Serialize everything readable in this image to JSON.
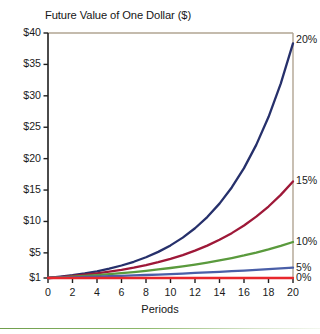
{
  "chart_data": {
    "type": "line",
    "title": "Future Value of One Dollar ($)",
    "xlabel": "Periods",
    "ylabel": "",
    "xlim": [
      0,
      20
    ],
    "ylim": [
      1,
      40
    ],
    "grid": false,
    "legend_position": "right-of-line-ends",
    "x": [
      0,
      1,
      2,
      3,
      4,
      5,
      6,
      7,
      8,
      9,
      10,
      11,
      12,
      13,
      14,
      15,
      16,
      17,
      18,
      19,
      20
    ],
    "xticks": [
      "0",
      "2",
      "4",
      "6",
      "8",
      "10",
      "12",
      "14",
      "16",
      "18",
      "20"
    ],
    "xtick_values": [
      0,
      2,
      4,
      6,
      8,
      10,
      12,
      14,
      16,
      18,
      20
    ],
    "yticks": [
      "$1",
      "$5",
      "$10",
      "$15",
      "$20",
      "$25",
      "$30",
      "$35",
      "$40"
    ],
    "ytick_values": [
      1,
      5,
      10,
      15,
      20,
      25,
      30,
      35,
      40
    ],
    "series": [
      {
        "name": "20%",
        "rate": 0.2,
        "color": "#26306b",
        "values": [
          1,
          1.2,
          1.44,
          1.73,
          2.07,
          2.49,
          2.99,
          3.58,
          4.3,
          5.16,
          6.19,
          7.43,
          8.92,
          10.7,
          12.84,
          15.41,
          18.49,
          22.19,
          26.62,
          31.95,
          38.34
        ]
      },
      {
        "name": "15%",
        "rate": 0.15,
        "color": "#9e1838",
        "values": [
          1,
          1.15,
          1.32,
          1.52,
          1.75,
          2.01,
          2.31,
          2.66,
          3.06,
          3.52,
          4.05,
          4.65,
          5.35,
          6.15,
          7.08,
          8.14,
          9.36,
          10.76,
          12.38,
          14.23,
          16.37
        ]
      },
      {
        "name": "10%",
        "rate": 0.1,
        "color": "#5a9a3d",
        "values": [
          1,
          1.1,
          1.21,
          1.33,
          1.46,
          1.61,
          1.77,
          1.95,
          2.14,
          2.36,
          2.59,
          2.85,
          3.14,
          3.45,
          3.8,
          4.18,
          4.59,
          5.05,
          5.56,
          6.12,
          6.73
        ]
      },
      {
        "name": "5%",
        "rate": 0.05,
        "color": "#4a5fa8",
        "values": [
          1,
          1.05,
          1.1,
          1.16,
          1.22,
          1.28,
          1.34,
          1.41,
          1.48,
          1.55,
          1.63,
          1.71,
          1.8,
          1.89,
          1.98,
          2.08,
          2.18,
          2.29,
          2.41,
          2.53,
          2.65
        ]
      },
      {
        "name": "0%",
        "rate": 0.0,
        "color": "#e8272c",
        "values": [
          1,
          1,
          1,
          1,
          1,
          1,
          1,
          1,
          1,
          1,
          1,
          1,
          1,
          1,
          1,
          1,
          1,
          1,
          1,
          1,
          1
        ]
      }
    ],
    "colors": {
      "rate_20": "#26306b",
      "rate_15": "#9e1838",
      "rate_10": "#5a9a3d",
      "rate_5": "#4a5fa8",
      "rate_0": "#e8272c",
      "axis": "#1e1e1e",
      "frame": "#b1a492",
      "accent_rule": "#6f9e4b"
    }
  }
}
